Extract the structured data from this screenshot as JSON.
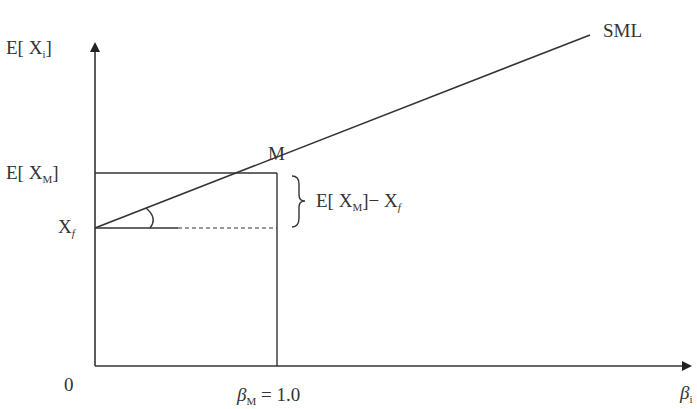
{
  "diagram": {
    "y_axis_label": {
      "main": "E[ X",
      "sub": "i",
      "close": "]"
    },
    "x_axis_label": {
      "main": "β",
      "sub": "i"
    },
    "origin_label": "0",
    "line_label": "SML",
    "point_label": "M",
    "ticks": {
      "y_market": {
        "main": "E[ X",
        "sub": "M",
        "close": "]"
      },
      "y_riskfree": {
        "main": "X",
        "sub": "f"
      },
      "x_market": {
        "main": "β",
        "sub": "M",
        "rest": " = 1.0"
      }
    },
    "brace_label": {
      "p1": "E[ X",
      "sub1": "M",
      "p2": "]− X",
      "sub2": "f"
    },
    "colors": {
      "line": "#333333",
      "background": "#ffffff"
    }
  }
}
